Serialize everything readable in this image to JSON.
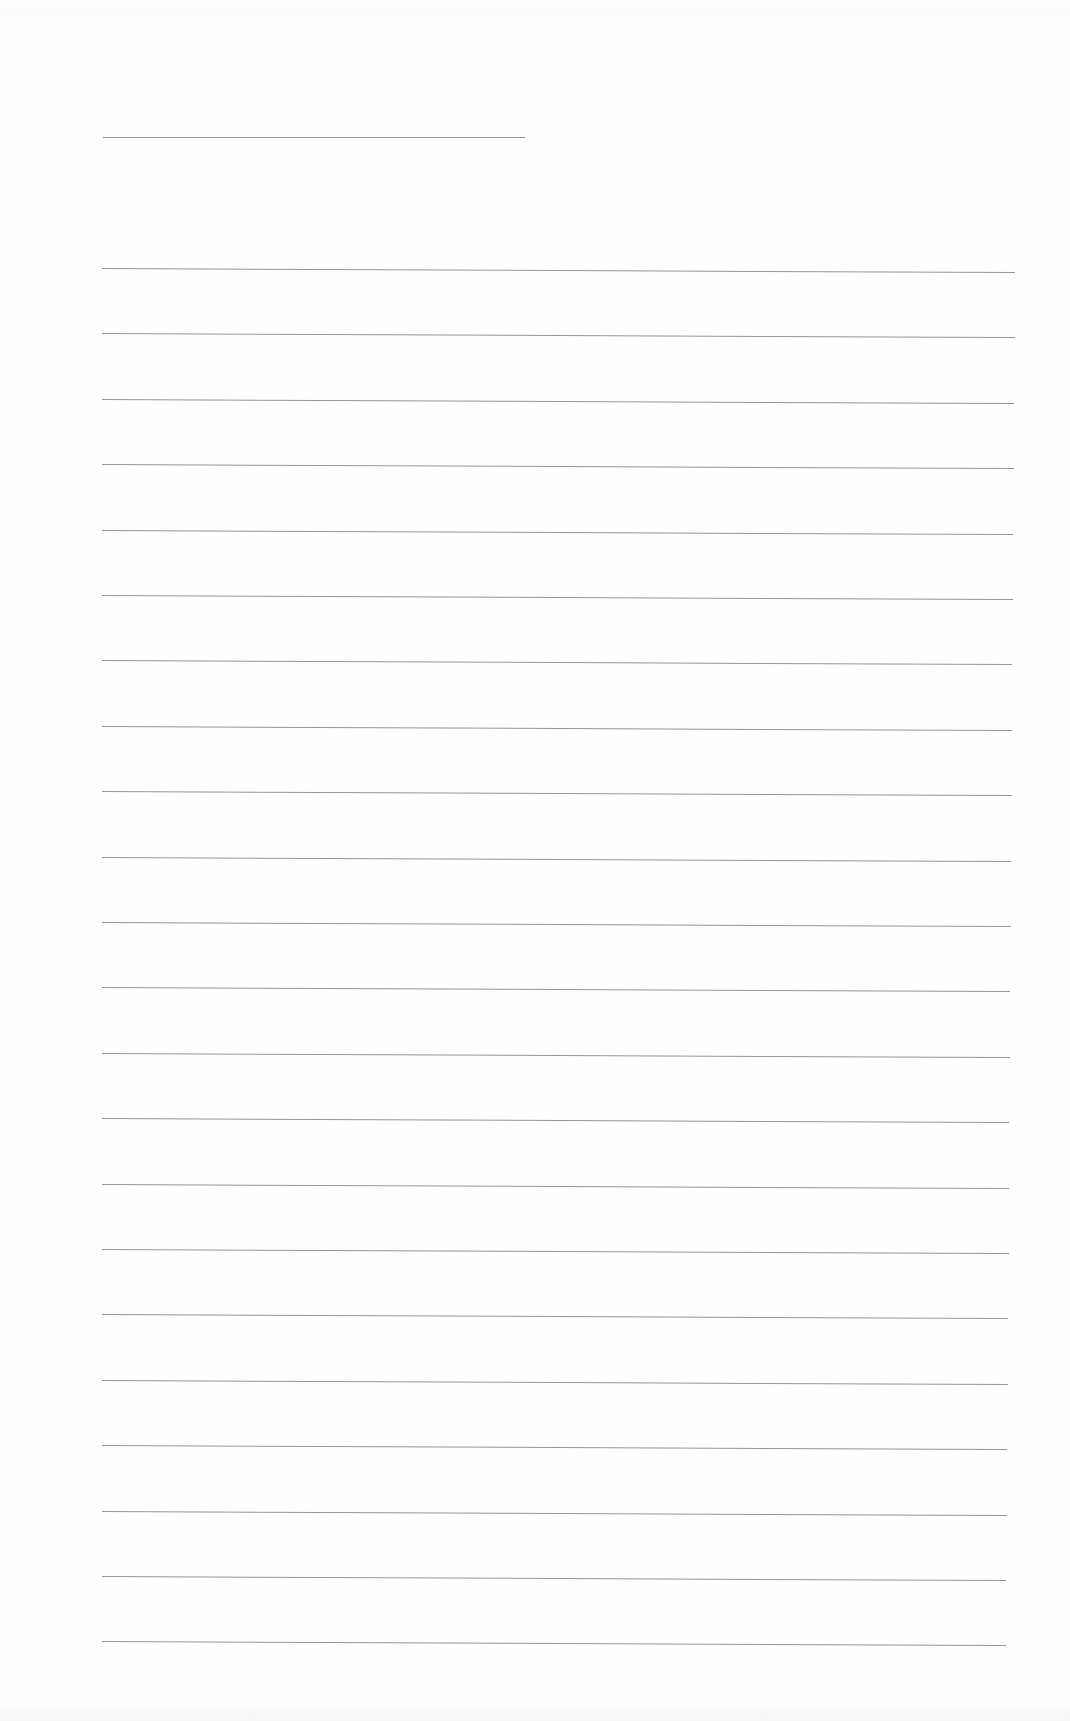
{
  "page": {
    "type": "blank lined writing sheet",
    "background_color": "#fefefe",
    "rule_color": "#8a8a8a"
  },
  "title_line": {
    "x1": 103,
    "x2": 525,
    "y": 137
  },
  "ruled_lines": {
    "count": 22,
    "x_start": 102,
    "x_end_first": 1015,
    "x_end_last": 1006,
    "y_first": 268,
    "spacing": 65.4,
    "skew_drop_px": 4
  }
}
